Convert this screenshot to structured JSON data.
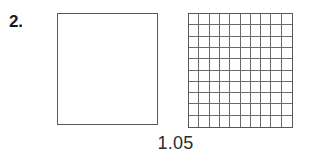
{
  "problem": {
    "number_label": "2.",
    "value_label": "1.05"
  },
  "models": {
    "whole_square": {
      "name_label": "whole unit square",
      "shaded": false,
      "shaded_count": 0,
      "total_parts": 1
    },
    "hundredths_grid": {
      "name_label": "hundredths grid",
      "rows": 10,
      "columns": 10,
      "total_cells": 100,
      "shaded_count": 0,
      "shaded_cells": []
    }
  },
  "colors": {
    "background": "#ffffff",
    "border": "#585858",
    "gridline": "#6a6a6a",
    "number_text": "#1a1a1a",
    "caption_text": "#2b2b2b",
    "shade_fill": "#6a6a6a"
  }
}
